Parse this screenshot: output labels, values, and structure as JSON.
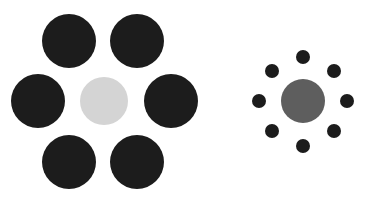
{
  "figure": {
    "width": 365,
    "height": 202,
    "background": "#ffffff"
  },
  "left_group": {
    "center": {
      "cx": 104,
      "cy": 101,
      "r": 24,
      "color": "#d4d4d4"
    },
    "surround_color": "#1c1c1c",
    "surround": [
      {
        "cx": 69,
        "cy": 41,
        "r": 27
      },
      {
        "cx": 137,
        "cy": 41,
        "r": 27
      },
      {
        "cx": 38,
        "cy": 101,
        "r": 27
      },
      {
        "cx": 171,
        "cy": 101,
        "r": 27
      },
      {
        "cx": 69,
        "cy": 162,
        "r": 27
      },
      {
        "cx": 137,
        "cy": 162,
        "r": 27
      }
    ]
  },
  "right_group": {
    "center": {
      "cx": 303,
      "cy": 101,
      "r": 22,
      "color": "#5e5e5e"
    },
    "surround_color": "#1c1c1c",
    "surround": [
      {
        "cx": 303,
        "cy": 57,
        "r": 7
      },
      {
        "cx": 272,
        "cy": 71,
        "r": 7
      },
      {
        "cx": 334,
        "cy": 71,
        "r": 7
      },
      {
        "cx": 259,
        "cy": 101,
        "r": 7
      },
      {
        "cx": 347,
        "cy": 101,
        "r": 7
      },
      {
        "cx": 272,
        "cy": 131,
        "r": 7
      },
      {
        "cx": 334,
        "cy": 131,
        "r": 7
      },
      {
        "cx": 303,
        "cy": 146,
        "r": 7
      }
    ]
  }
}
